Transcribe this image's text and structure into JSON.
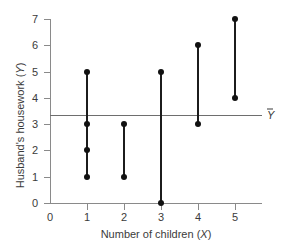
{
  "chart_data": {
    "type": "scatter",
    "title": "",
    "xlabel": "Number of children (X)",
    "ylabel": "Husband's housework (Y)",
    "xlim": [
      0,
      5
    ],
    "ylim": [
      0,
      7
    ],
    "x_ticks": [
      0,
      1,
      2,
      3,
      4,
      5
    ],
    "y_ticks": [
      0,
      1,
      2,
      3,
      4,
      5,
      6,
      7
    ],
    "grid": false,
    "legend": "none",
    "marker_color": "#111111",
    "axis_color": "#8a8a8a",
    "mean_line": {
      "value": 3.33,
      "label": "Y",
      "label_overbar": true,
      "color": "#6e6e6e"
    },
    "groups": [
      {
        "x": 1,
        "values": [
          5,
          3,
          2,
          1
        ]
      },
      {
        "x": 2,
        "values": [
          3,
          1
        ]
      },
      {
        "x": 3,
        "values": [
          5,
          0
        ]
      },
      {
        "x": 4,
        "values": [
          6,
          3
        ]
      },
      {
        "x": 5,
        "values": [
          7,
          4
        ]
      }
    ],
    "points": [
      {
        "x": 1,
        "y": 5
      },
      {
        "x": 1,
        "y": 3
      },
      {
        "x": 1,
        "y": 2
      },
      {
        "x": 1,
        "y": 1
      },
      {
        "x": 2,
        "y": 3
      },
      {
        "x": 2,
        "y": 1
      },
      {
        "x": 3,
        "y": 5
      },
      {
        "x": 3,
        "y": 0
      },
      {
        "x": 4,
        "y": 6
      },
      {
        "x": 4,
        "y": 3
      },
      {
        "x": 5,
        "y": 7
      },
      {
        "x": 5,
        "y": 4
      }
    ]
  },
  "axis_titles": {
    "x_main": "Number of children (",
    "x_var": "X",
    "x_close": ")",
    "y_main": "Husband's housework (",
    "y_var": "Y",
    "y_close": ")"
  }
}
